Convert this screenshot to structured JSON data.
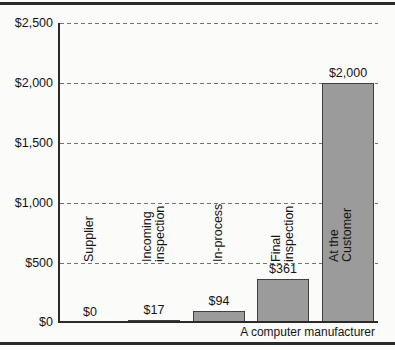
{
  "figure": {
    "caption": "A computer manufacturer"
  },
  "chart_data": {
    "type": "bar",
    "title": "",
    "xlabel": "",
    "ylabel": "",
    "categories": [
      "Supplier",
      "Incoming\ninspection",
      "In-process",
      "Final\ninspection",
      "At the Customer"
    ],
    "values": [
      0,
      17,
      94,
      361,
      2000
    ],
    "value_labels": [
      "$0",
      "$17",
      "$94",
      "$361",
      "$2,000"
    ],
    "ytick_labels": [
      "$2,500",
      "$2,000",
      "$1,500",
      "$1,000",
      "$500",
      "$0"
    ],
    "ylim": [
      0,
      2500
    ],
    "ytick_interval": 500,
    "grid": "horizontal dashed gridlines at $500 intervals",
    "legend": "none",
    "bar_color": "#9b9b9b",
    "bar_border_color": "#3f3f3f",
    "axis_color": "#2b2b2b",
    "caption": "A computer manufacturer"
  }
}
